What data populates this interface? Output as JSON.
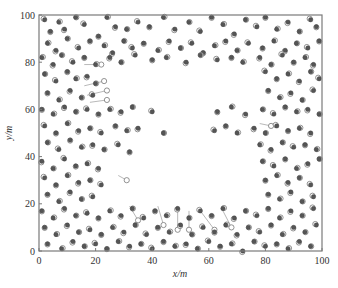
{
  "chart_data": {
    "type": "scatter",
    "title": "",
    "xlabel": "x/m",
    "ylabel": "y/m",
    "xlim": [
      0,
      100
    ],
    "ylim": [
      0,
      100
    ],
    "x_ticks": [
      "0",
      "20",
      "40",
      "60",
      "80",
      "100"
    ],
    "y_ticks": [
      "0",
      "20",
      "40",
      "60",
      "80",
      "100"
    ],
    "grid": false,
    "legend": null,
    "marker_styles": {
      "node": {
        "shape": "filled-circle",
        "color": "#555555"
      },
      "estimate": {
        "shape": "hollow-circle",
        "color": "#777777"
      },
      "link": {
        "shape": "line",
        "color": "#888888"
      }
    },
    "empty_region": {
      "x": [
        22,
        77
      ],
      "y": [
        22,
        80
      ]
    },
    "series": [
      {
        "name": "nodes",
        "points": [
          [
            2,
            98
          ],
          [
            4,
            93
          ],
          [
            7,
            97
          ],
          [
            9,
            94
          ],
          [
            13,
            99
          ],
          [
            16,
            96
          ],
          [
            21,
            91
          ],
          [
            24,
            99
          ],
          [
            27,
            95
          ],
          [
            31,
            94
          ],
          [
            35,
            97
          ],
          [
            39,
            95
          ],
          [
            44,
            99
          ],
          [
            48,
            94
          ],
          [
            53,
            97
          ],
          [
            57,
            93
          ],
          [
            61,
            99
          ],
          [
            65,
            96
          ],
          [
            69,
            92
          ],
          [
            73,
            98
          ],
          [
            77,
            95
          ],
          [
            80,
            99
          ],
          [
            84,
            94
          ],
          [
            88,
            97
          ],
          [
            92,
            93
          ],
          [
            96,
            98
          ],
          [
            98,
            95
          ],
          [
            3,
            88
          ],
          [
            6,
            85
          ],
          [
            10,
            90
          ],
          [
            14,
            86
          ],
          [
            18,
            89
          ],
          [
            23,
            87
          ],
          [
            26,
            84
          ],
          [
            30,
            89
          ],
          [
            33,
            86
          ],
          [
            37,
            88
          ],
          [
            42,
            85
          ],
          [
            46,
            89
          ],
          [
            50,
            86
          ],
          [
            54,
            88
          ],
          [
            58,
            84
          ],
          [
            62,
            87
          ],
          [
            66,
            89
          ],
          [
            70,
            85
          ],
          [
            74,
            88
          ],
          [
            79,
            86
          ],
          [
            83,
            89
          ],
          [
            87,
            85
          ],
          [
            91,
            88
          ],
          [
            95,
            86
          ],
          [
            99,
            89
          ],
          [
            1,
            82
          ],
          [
            5,
            79
          ],
          [
            8,
            83
          ],
          [
            12,
            80
          ],
          [
            16,
            82
          ],
          [
            20,
            79
          ],
          [
            25,
            82
          ],
          [
            29,
            80
          ],
          [
            34,
            83
          ],
          [
            40,
            81
          ],
          [
            45,
            82
          ],
          [
            52,
            80
          ],
          [
            57,
            83
          ],
          [
            63,
            81
          ],
          [
            68,
            82
          ],
          [
            72,
            80
          ],
          [
            78,
            82
          ],
          [
            82,
            79
          ],
          [
            86,
            83
          ],
          [
            90,
            80
          ],
          [
            94,
            82
          ],
          [
            97,
            79
          ],
          [
            2,
            75
          ],
          [
            6,
            72
          ],
          [
            10,
            76
          ],
          [
            13,
            73
          ],
          [
            17,
            74
          ],
          [
            20,
            71
          ],
          [
            80,
            76
          ],
          [
            84,
            73
          ],
          [
            88,
            75
          ],
          [
            92,
            72
          ],
          [
            96,
            76
          ],
          [
            99,
            73
          ],
          [
            3,
            67
          ],
          [
            7,
            64
          ],
          [
            11,
            68
          ],
          [
            15,
            65
          ],
          [
            19,
            66
          ],
          [
            81,
            68
          ],
          [
            85,
            65
          ],
          [
            89,
            67
          ],
          [
            93,
            64
          ],
          [
            97,
            68
          ],
          [
            1,
            60
          ],
          [
            5,
            58
          ],
          [
            9,
            61
          ],
          [
            13,
            59
          ],
          [
            17,
            60
          ],
          [
            21,
            58
          ],
          [
            25,
            60
          ],
          [
            29,
            59
          ],
          [
            33,
            61
          ],
          [
            40,
            59
          ],
          [
            63,
            59
          ],
          [
            68,
            61
          ],
          [
            73,
            58
          ],
          [
            79,
            60
          ],
          [
            83,
            58
          ],
          [
            87,
            61
          ],
          [
            91,
            59
          ],
          [
            95,
            60
          ],
          [
            99,
            58
          ],
          [
            2,
            53
          ],
          [
            6,
            50
          ],
          [
            10,
            54
          ],
          [
            14,
            51
          ],
          [
            18,
            52
          ],
          [
            22,
            50
          ],
          [
            27,
            53
          ],
          [
            31,
            51
          ],
          [
            35,
            52
          ],
          [
            44,
            50
          ],
          [
            62,
            51
          ],
          [
            66,
            53
          ],
          [
            70,
            50
          ],
          [
            76,
            52
          ],
          [
            80,
            50
          ],
          [
            84,
            53
          ],
          [
            88,
            51
          ],
          [
            92,
            52
          ],
          [
            96,
            50
          ],
          [
            3,
            46
          ],
          [
            7,
            43
          ],
          [
            11,
            47
          ],
          [
            15,
            44
          ],
          [
            19,
            45
          ],
          [
            23,
            43
          ],
          [
            28,
            45
          ],
          [
            32,
            42
          ],
          [
            78,
            45
          ],
          [
            82,
            43
          ],
          [
            86,
            46
          ],
          [
            90,
            44
          ],
          [
            94,
            45
          ],
          [
            98,
            43
          ],
          [
            1,
            38
          ],
          [
            5,
            35
          ],
          [
            9,
            39
          ],
          [
            13,
            36
          ],
          [
            17,
            37
          ],
          [
            21,
            35
          ],
          [
            79,
            38
          ],
          [
            83,
            36
          ],
          [
            87,
            39
          ],
          [
            91,
            35
          ],
          [
            95,
            37
          ],
          [
            99,
            39
          ],
          [
            2,
            31
          ],
          [
            6,
            28
          ],
          [
            10,
            32
          ],
          [
            14,
            29
          ],
          [
            18,
            30
          ],
          [
            22,
            28
          ],
          [
            80,
            30
          ],
          [
            84,
            32
          ],
          [
            88,
            29
          ],
          [
            92,
            31
          ],
          [
            96,
            28
          ],
          [
            3,
            24
          ],
          [
            7,
            21
          ],
          [
            11,
            25
          ],
          [
            15,
            22
          ],
          [
            19,
            23
          ],
          [
            81,
            24
          ],
          [
            85,
            22
          ],
          [
            89,
            25
          ],
          [
            93,
            21
          ],
          [
            97,
            23
          ],
          [
            1,
            17
          ],
          [
            5,
            14
          ],
          [
            9,
            18
          ],
          [
            13,
            15
          ],
          [
            17,
            16
          ],
          [
            21,
            14
          ],
          [
            25,
            17
          ],
          [
            29,
            15
          ],
          [
            33,
            18
          ],
          [
            37,
            14
          ],
          [
            41,
            17
          ],
          [
            45,
            15
          ],
          [
            49,
            18
          ],
          [
            53,
            14
          ],
          [
            57,
            17
          ],
          [
            61,
            15
          ],
          [
            65,
            18
          ],
          [
            69,
            14
          ],
          [
            73,
            17
          ],
          [
            77,
            15
          ],
          [
            81,
            18
          ],
          [
            85,
            14
          ],
          [
            89,
            17
          ],
          [
            93,
            15
          ],
          [
            97,
            18
          ],
          [
            2,
            10
          ],
          [
            6,
            7
          ],
          [
            10,
            11
          ],
          [
            14,
            8
          ],
          [
            18,
            9
          ],
          [
            22,
            7
          ],
          [
            26,
            10
          ],
          [
            30,
            8
          ],
          [
            34,
            11
          ],
          [
            38,
            7
          ],
          [
            42,
            10
          ],
          [
            46,
            8
          ],
          [
            50,
            11
          ],
          [
            54,
            7
          ],
          [
            58,
            10
          ],
          [
            62,
            8
          ],
          [
            66,
            11
          ],
          [
            70,
            7
          ],
          [
            74,
            10
          ],
          [
            78,
            8
          ],
          [
            82,
            11
          ],
          [
            86,
            7
          ],
          [
            90,
            10
          ],
          [
            94,
            8
          ],
          [
            98,
            11
          ],
          [
            3,
            3
          ],
          [
            8,
            1
          ],
          [
            12,
            4
          ],
          [
            16,
            2
          ],
          [
            20,
            3
          ],
          [
            24,
            1
          ],
          [
            28,
            4
          ],
          [
            32,
            2
          ],
          [
            36,
            3
          ],
          [
            40,
            1
          ],
          [
            44,
            4
          ],
          [
            48,
            2
          ],
          [
            52,
            3
          ],
          [
            56,
            1
          ],
          [
            60,
            4
          ],
          [
            64,
            2
          ],
          [
            68,
            3
          ],
          [
            72,
            0
          ],
          [
            76,
            4
          ],
          [
            80,
            2
          ],
          [
            84,
            3
          ],
          [
            88,
            1
          ],
          [
            92,
            4
          ],
          [
            96,
            2
          ]
        ]
      }
    ],
    "links": [
      [
        [
          16,
          70
        ],
        [
          23,
          72
        ]
      ],
      [
        [
          17,
          66
        ],
        [
          24,
          68
        ]
      ],
      [
        [
          18,
          63
        ],
        [
          24,
          64
        ]
      ],
      [
        [
          16,
          79
        ],
        [
          22,
          79
        ]
      ],
      [
        [
          78,
          54
        ],
        [
          82,
          53
        ]
      ],
      [
        [
          32,
          19
        ],
        [
          35,
          13
        ]
      ],
      [
        [
          42,
          19
        ],
        [
          44,
          11
        ]
      ],
      [
        [
          49,
          17
        ],
        [
          49,
          9
        ]
      ],
      [
        [
          53,
          17
        ],
        [
          53,
          9
        ]
      ],
      [
        [
          57,
          17
        ],
        [
          62,
          9
        ]
      ],
      [
        [
          65,
          17
        ],
        [
          68,
          10
        ]
      ],
      [
        [
          28,
          32
        ],
        [
          31,
          30
        ]
      ]
    ]
  },
  "caption": {
    "text": ""
  }
}
